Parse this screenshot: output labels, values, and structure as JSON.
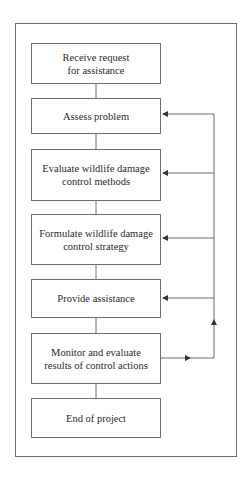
{
  "diagram": {
    "type": "flowchart",
    "steps": [
      {
        "id": "receive",
        "label": "Receive request\nfor assistance",
        "line1": "Receive request",
        "line2": "for assistance"
      },
      {
        "id": "assess",
        "label": "Assess problem",
        "line1": "Assess problem"
      },
      {
        "id": "evaluate",
        "label": "Evaluate wildlife damage control methods",
        "line1": "Evaluate wildlife damage",
        "line2": "control methods"
      },
      {
        "id": "formulate",
        "label": "Formulate wildlife damage control strategy",
        "line1": "Formulate wildlife damage",
        "line2": "control strategy"
      },
      {
        "id": "provide",
        "label": "Provide assistance",
        "line1": "Provide assistance"
      },
      {
        "id": "monitor",
        "label": "Monitor and evaluate results of control actions",
        "line1": "Monitor and evaluate",
        "line2": "results of control actions"
      },
      {
        "id": "end",
        "label": "End of project",
        "line1": "End of project"
      }
    ],
    "edges": [
      {
        "from": "receive",
        "to": "assess"
      },
      {
        "from": "assess",
        "to": "evaluate"
      },
      {
        "from": "evaluate",
        "to": "formulate"
      },
      {
        "from": "formulate",
        "to": "provide"
      },
      {
        "from": "provide",
        "to": "monitor"
      },
      {
        "from": "monitor",
        "to": "end"
      },
      {
        "from": "monitor",
        "to": "assess",
        "kind": "feedback"
      },
      {
        "from": "monitor",
        "to": "evaluate",
        "kind": "feedback"
      },
      {
        "from": "monitor",
        "to": "formulate",
        "kind": "feedback"
      },
      {
        "from": "monitor",
        "to": "provide",
        "kind": "feedback"
      }
    ],
    "colors": {
      "line": "#6e6e6e",
      "text": "#2a2a2a",
      "background": "#ffffff"
    }
  }
}
